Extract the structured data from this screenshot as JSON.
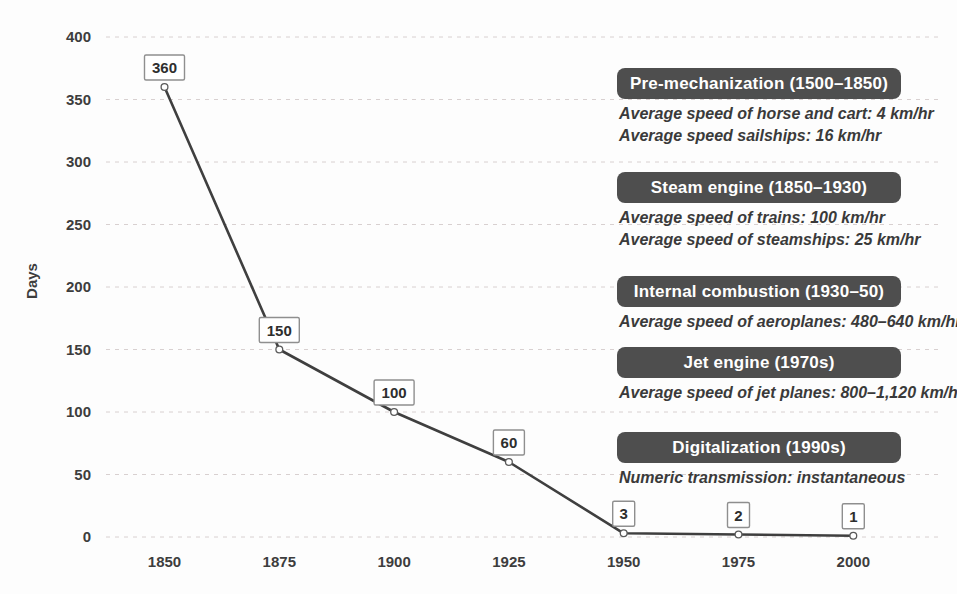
{
  "chart_data": {
    "type": "line",
    "x": [
      1850,
      1875,
      1900,
      1925,
      1950,
      1975,
      2000
    ],
    "values": [
      360,
      150,
      100,
      60,
      3,
      2,
      1
    ],
    "point_labels": [
      "360",
      "150",
      "100",
      "60",
      "3",
      "2",
      "1"
    ],
    "title": "",
    "xlabel": "",
    "ylabel": "Days",
    "xticks": [
      "1850",
      "1875",
      "1900",
      "1925",
      "1950",
      "1975",
      "2000"
    ],
    "yticks": [
      0,
      50,
      100,
      150,
      200,
      250,
      300,
      350,
      400
    ],
    "ylim": [
      0,
      400
    ],
    "grid": "horizontal-dashed",
    "legend": "none",
    "marker": "open-circle",
    "point_label_style": "boxed"
  },
  "annotations": [
    {
      "title": "Pre-mechanization (1500–1850)",
      "lines": [
        "Average speed of horse and cart: 4 km/hr",
        "Average speed sailships: 16 km/hr"
      ]
    },
    {
      "title": "Steam engine (1850–1930)",
      "lines": [
        "Average speed of trains: 100 km/hr",
        "Average speed of steamships: 25 km/hr"
      ]
    },
    {
      "title": "Internal combustion (1930–50)",
      "lines": [
        "Average speed of aeroplanes: 480–640 km/hr"
      ]
    },
    {
      "title": "Jet engine (1970s)",
      "lines": [
        "Average speed of jet planes: 800–1,120 km/hr"
      ]
    },
    {
      "title": "Digitalization (1990s)",
      "lines": [
        "Numeric transmission: instantaneous"
      ]
    }
  ],
  "colors": {
    "background": "#fdfdfd",
    "badge_bg": "#4e4e4e",
    "badge_text": "#ffffff",
    "body_text": "#3a3a3a",
    "grid_line": "#d8d0d0",
    "data_line": "#3f3f3f",
    "marker_fill": "#ffffff",
    "marker_stroke": "#5a5a5a",
    "tick_text": "#3d3d3d",
    "label_box_border": "#8f8f8f"
  }
}
